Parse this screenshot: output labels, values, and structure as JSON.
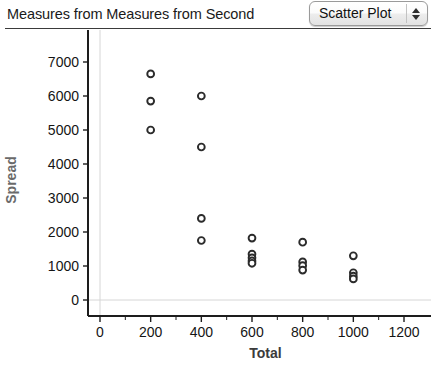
{
  "header": {
    "title": "Measures from Measures from Second ",
    "plot_type": {
      "selected": "Scatter Plot",
      "spinner_up_icon": "caret-up-icon",
      "spinner_down_icon": "caret-down-icon"
    }
  },
  "chart_data": {
    "type": "scatter",
    "title": "Measures from Measures from Second ",
    "xlabel": "Total",
    "ylabel": "Spread",
    "xlim": [
      -120,
      1290
    ],
    "ylim": [
      -420,
      7350
    ],
    "xticks": [
      0,
      200,
      400,
      600,
      800,
      1000,
      1200
    ],
    "yticks": [
      0,
      1000,
      2000,
      3000,
      4000,
      5000,
      6000,
      7000
    ],
    "xtick_labels": [
      "0",
      "200",
      "400",
      "600",
      "800",
      "1000",
      "1200"
    ],
    "ytick_labels": [
      "0",
      "1000",
      "2000",
      "3000",
      "4000",
      "5000",
      "6000",
      "7000"
    ],
    "grid": true,
    "gridlines": {
      "vertical_at_x": 0,
      "horizontal_at_y": 0
    },
    "legend": null,
    "marker": {
      "shape": "circle",
      "open": true,
      "radius": 3.4,
      "edge_color": "#2b2b2b",
      "face_color": "#ffffff"
    },
    "points": [
      {
        "x": 200,
        "y": 6650
      },
      {
        "x": 200,
        "y": 5850
      },
      {
        "x": 200,
        "y": 5000
      },
      {
        "x": 400,
        "y": 6000
      },
      {
        "x": 400,
        "y": 4500
      },
      {
        "x": 400,
        "y": 2400
      },
      {
        "x": 400,
        "y": 1750
      },
      {
        "x": 600,
        "y": 1820
      },
      {
        "x": 600,
        "y": 1350
      },
      {
        "x": 600,
        "y": 1240
      },
      {
        "x": 600,
        "y": 1150
      },
      {
        "x": 600,
        "y": 1080
      },
      {
        "x": 800,
        "y": 1700
      },
      {
        "x": 800,
        "y": 1120
      },
      {
        "x": 800,
        "y": 1010
      },
      {
        "x": 800,
        "y": 880
      },
      {
        "x": 1000,
        "y": 1300
      },
      {
        "x": 1000,
        "y": 800
      },
      {
        "x": 1000,
        "y": 700
      },
      {
        "x": 1000,
        "y": 620
      }
    ]
  }
}
